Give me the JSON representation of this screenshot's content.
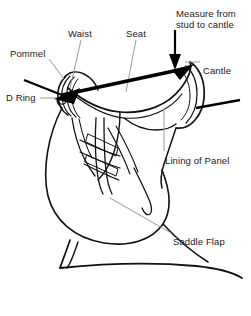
{
  "figure": {
    "background_color": "#ffffff",
    "line_color": "#111111",
    "leader_color": "#9a9a9a",
    "text_color": "#1a1a1a",
    "width": 251,
    "height": 316
  },
  "labels": [
    {
      "id": "measure-from-stud-to-cantle",
      "text": "Measure from\nstud to cantle",
      "x": 176,
      "y": 8,
      "align": "left"
    },
    {
      "id": "waist",
      "text": "Waist",
      "x": 68,
      "y": 28,
      "align": "left"
    },
    {
      "id": "seat",
      "text": "Seat",
      "x": 126,
      "y": 28,
      "align": "left"
    },
    {
      "id": "pommel",
      "text": "Pommel",
      "x": 10,
      "y": 48,
      "align": "left"
    },
    {
      "id": "cantle",
      "text": "Cantle",
      "x": 203,
      "y": 65,
      "align": "left"
    },
    {
      "id": "d-ring",
      "text": "D Ring",
      "x": 6,
      "y": 92,
      "align": "left"
    },
    {
      "id": "lining-of-panel",
      "text": "Lining of Panel",
      "x": 165,
      "y": 155,
      "align": "left"
    },
    {
      "id": "saddle-flap",
      "text": "Saddle Flap",
      "x": 173,
      "y": 236,
      "align": "left"
    }
  ],
  "annotations": {
    "measure_arrow": {
      "name": "double-headed-measure-arrow",
      "from": [
        58,
        96
      ],
      "to": [
        190,
        67
      ],
      "style": "double-headed-thick"
    },
    "stud_arrow": {
      "name": "stud-to-cantle-down-arrow",
      "from": [
        175,
        30
      ],
      "to": [
        175,
        66
      ],
      "style": "single-headed-vertical"
    },
    "leaders": [
      {
        "name": "leader-waist",
        "points": [
          [
            81,
            40
          ],
          [
            70,
            88
          ]
        ]
      },
      {
        "name": "leader-seat",
        "points": [
          [
            136,
            40
          ],
          [
            126,
            92
          ]
        ]
      },
      {
        "name": "leader-pommel",
        "points": [
          [
            49,
            59
          ],
          [
            64,
            79
          ]
        ]
      },
      {
        "name": "leader-cantle",
        "points": [
          [
            200,
            62
          ],
          [
            185,
            62
          ]
        ]
      },
      {
        "name": "leader-d-ring",
        "points": [
          [
            40,
            98
          ],
          [
            57,
            98
          ]
        ]
      },
      {
        "name": "leader-lining-of-panel",
        "points": [
          [
            164,
            151
          ],
          [
            164,
            108
          ]
        ]
      },
      {
        "name": "leader-saddle-flap",
        "points": [
          [
            171,
            233
          ],
          [
            110,
            198
          ]
        ]
      }
    ]
  }
}
